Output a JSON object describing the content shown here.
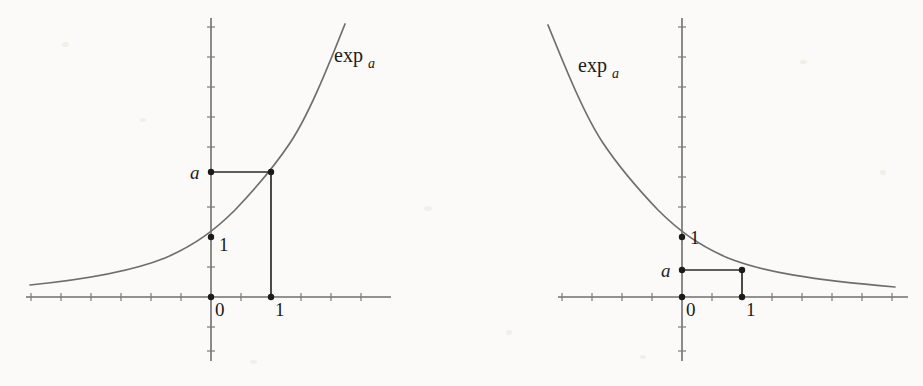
{
  "figure": {
    "background_color": "#fbfaf8",
    "curve_color": "#6e6e6e",
    "axis_color": "#6f6f6f",
    "connector_color": "#2a2a2a",
    "marker_color": "#1b1b1b"
  },
  "panels": [
    {
      "id": "growth",
      "name": "exponential-growth-plot",
      "description": "exp_a with a greater than 1",
      "function_label": {
        "base": "exp",
        "subscript": "a"
      },
      "function_label_pos": {
        "x": 334,
        "y": 62
      },
      "axes": {
        "origin": {
          "x": 211,
          "y": 297
        },
        "x_axis": {
          "x1": 26,
          "y1": 297,
          "x2": 391,
          "y2": 297
        },
        "y_axis": {
          "x1": 211,
          "y1": 18,
          "x2": 211,
          "y2": 361
        },
        "unit_px": 60,
        "half_unit_px": 30,
        "x_ticks": [
          -3,
          -2.5,
          -2,
          -1.5,
          -1,
          -0.5,
          0.5,
          1.5,
          2,
          2.5,
          3
        ],
        "y_ticks": [
          -1.5,
          -1,
          -0.5,
          0.5,
          1.5,
          2.5,
          3,
          3.5,
          4,
          4.5
        ]
      },
      "labels": [
        {
          "text": "0",
          "x": 215,
          "y": 316,
          "italic": false,
          "name": "x-axis-label-zero"
        },
        {
          "text": "1",
          "x": 275,
          "y": 316,
          "italic": false,
          "name": "x-axis-label-one"
        },
        {
          "text": "1",
          "x": 219,
          "y": 251,
          "italic": false,
          "name": "y-axis-label-one"
        },
        {
          "text": "a",
          "x": 190,
          "y": 179,
          "italic": true,
          "name": "y-axis-label-a"
        }
      ],
      "markers": [
        {
          "x": 211,
          "y": 297,
          "name": "point-origin"
        },
        {
          "x": 271,
          "y": 297,
          "name": "point-x-one"
        },
        {
          "x": 211,
          "y": 237,
          "name": "point-y-one"
        },
        {
          "x": 211,
          "y": 172,
          "name": "point-y-a"
        },
        {
          "x": 271,
          "y": 172,
          "name": "point-curve-at-one"
        }
      ],
      "connectors": [
        {
          "x1": 211,
          "y1": 172,
          "x2": 271,
          "y2": 172,
          "name": "horizontal-connector-a"
        },
        {
          "x1": 271,
          "y1": 172,
          "x2": 271,
          "y2": 297,
          "name": "vertical-connector-one"
        }
      ],
      "curve_path": "M 30 285 C 80 280, 130 272, 165 258 C 195 245, 215 230, 235 210 C 255 189, 272 170, 290 143 C 308 116, 326 72, 345 24"
    },
    {
      "id": "decay",
      "name": "exponential-decay-plot",
      "description": "exp_a with a between 0 and 1",
      "function_label": {
        "base": "exp",
        "subscript": "a"
      },
      "function_label_pos": {
        "x": 578,
        "y": 72
      },
      "axes": {
        "origin": {
          "x": 682,
          "y": 297
        },
        "x_axis": {
          "x1": 558,
          "y1": 297,
          "x2": 908,
          "y2": 297
        },
        "y_axis": {
          "x1": 682,
          "y1": 18,
          "x2": 682,
          "y2": 361
        },
        "unit_px": 60,
        "half_unit_px": 30,
        "x_ticks": [
          -2,
          -1.5,
          -1,
          -0.5,
          0.5,
          1.5,
          2,
          2.5,
          3,
          3.5
        ],
        "y_ticks": [
          -1.5,
          -1,
          -0.5,
          0.5,
          1.5,
          2.5,
          3,
          3.5,
          4,
          4.5
        ]
      },
      "labels": [
        {
          "text": "0",
          "x": 686,
          "y": 316,
          "italic": false,
          "name": "x-axis-label-zero"
        },
        {
          "text": "1",
          "x": 746,
          "y": 316,
          "italic": false,
          "name": "x-axis-label-one"
        },
        {
          "text": "1",
          "x": 690,
          "y": 244,
          "italic": false,
          "name": "y-axis-label-one"
        },
        {
          "text": "a",
          "x": 661,
          "y": 277,
          "italic": true,
          "name": "y-axis-label-a"
        }
      ],
      "markers": [
        {
          "x": 682,
          "y": 297,
          "name": "point-origin"
        },
        {
          "x": 742,
          "y": 297,
          "name": "point-x-one"
        },
        {
          "x": 682,
          "y": 237,
          "name": "point-y-one"
        },
        {
          "x": 682,
          "y": 270,
          "name": "point-y-a"
        },
        {
          "x": 742,
          "y": 270,
          "name": "point-curve-at-one"
        }
      ],
      "connectors": [
        {
          "x1": 682,
          "y1": 270,
          "x2": 742,
          "y2": 270,
          "name": "horizontal-connector-a"
        },
        {
          "x1": 742,
          "y1": 270,
          "x2": 742,
          "y2": 297,
          "name": "vertical-connector-one"
        }
      ],
      "curve_path": "M 548 25 C 567 72, 585 116, 603 143 C 621 170, 638 189, 658 210 C 678 230, 698 245, 728 258 C 763 272, 813 280, 895 287"
    }
  ]
}
